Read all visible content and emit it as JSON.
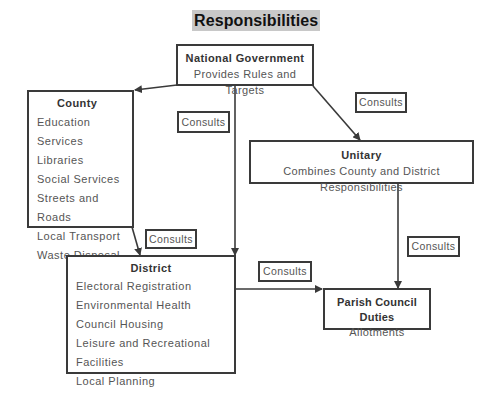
{
  "title": "Responsibilities",
  "nodes": {
    "national": {
      "title": "National Government",
      "subtitle": "Provides Rules and Targets"
    },
    "county": {
      "title": "County",
      "items": [
        "Education Services",
        "Libraries",
        "Social Services",
        "Streets and Roads",
        "Local Transport",
        "Waste Disposal"
      ]
    },
    "unitary": {
      "title": "Unitary",
      "subtitle": "Combines County and District Responsibilities"
    },
    "district": {
      "title": "District",
      "items": [
        "Electoral Registration",
        "Environmental Health",
        "Council Housing",
        "Leisure and Recreational Facilities",
        "Local Planning"
      ]
    },
    "parish": {
      "title": "Parish Council Duties",
      "subtitle": "Allotments"
    }
  },
  "edge_labels": {
    "national_to_district": "Consults",
    "national_to_unitary": "Consults",
    "county_to_district": "Consults",
    "district_to_parish": "Consults",
    "unitary_to_parish": "Consults"
  },
  "colors": {
    "line": "#3a3a3a",
    "title_highlight": "#c8c8c8",
    "text": "#555555"
  }
}
